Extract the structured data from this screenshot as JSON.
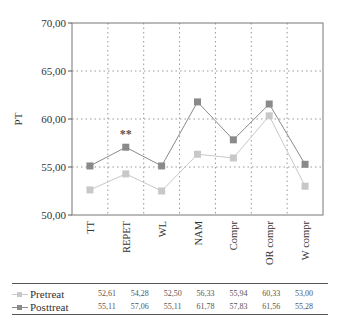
{
  "chart_data": {
    "type": "line",
    "title": "",
    "xlabel": "",
    "ylabel": "PT",
    "ylim": [
      50,
      70
    ],
    "yticks": [
      "50,00",
      "55,00",
      "60,00",
      "65,00",
      "70,00"
    ],
    "grid": true,
    "categories": [
      "TT",
      "REPET",
      "WL",
      "NAM",
      "Compr",
      "OR compr",
      "W compr"
    ],
    "series": [
      {
        "name": "Pretreat",
        "color": "#c8c8c8",
        "values": [
          52.61,
          54.28,
          52.5,
          56.33,
          55.94,
          60.33,
          53.0
        ],
        "labels": [
          "52,61",
          "54,28",
          "52,50",
          "56,33",
          "55,94",
          "60,33",
          "53,00"
        ]
      },
      {
        "name": "Posttreat",
        "color": "#8a8a8a",
        "values": [
          55.11,
          57.06,
          55.11,
          61.78,
          57.83,
          61.56,
          55.28
        ],
        "labels": [
          "55,11",
          "57,06",
          "55,11",
          "61,78",
          "57,83",
          "61,56",
          "55,28"
        ]
      }
    ],
    "annotations": [
      {
        "category": "REPET",
        "text": "**"
      }
    ],
    "legend_position": "bottom-table"
  }
}
